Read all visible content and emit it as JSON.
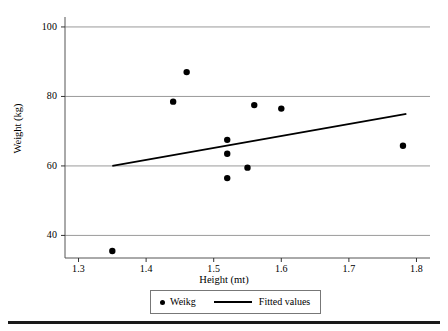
{
  "chart_data": {
    "type": "scatter",
    "title": "",
    "xlabel": "Height (mt)",
    "ylabel": "Weight (kg)",
    "xlim": [
      1.28,
      1.82
    ],
    "ylim": [
      33.5,
      102.0
    ],
    "xticks": [
      "1.3",
      "1.4",
      "1.5",
      "1.6",
      "1.7",
      "1.8"
    ],
    "xtick_values": [
      1.3,
      1.4,
      1.5,
      1.6,
      1.7,
      1.8
    ],
    "yticks": [
      "40",
      "60",
      "80",
      "100"
    ],
    "ytick_values": [
      40,
      60,
      80,
      100
    ],
    "grid": "horizontal",
    "legend_position": "below-axes",
    "series": [
      {
        "name": "Weikg",
        "type": "scatter",
        "marker": "circle",
        "color": "#000000",
        "points": [
          {
            "x": 1.35,
            "y": 35.5
          },
          {
            "x": 1.44,
            "y": 78.5
          },
          {
            "x": 1.46,
            "y": 87.0
          },
          {
            "x": 1.52,
            "y": 67.5
          },
          {
            "x": 1.52,
            "y": 63.5
          },
          {
            "x": 1.52,
            "y": 56.5
          },
          {
            "x": 1.55,
            "y": 59.5
          },
          {
            "x": 1.56,
            "y": 77.5
          },
          {
            "x": 1.6,
            "y": 76.5
          },
          {
            "x": 1.78,
            "y": 65.8
          }
        ]
      },
      {
        "name": "Fitted values",
        "type": "line",
        "color": "#000000",
        "points": [
          {
            "x": 1.35,
            "y": 60.0
          },
          {
            "x": 1.785,
            "y": 75.0
          }
        ]
      }
    ]
  },
  "legend": {
    "entries": [
      {
        "label": "Weikg",
        "glyph": "dot-marker"
      },
      {
        "label": "Fitted values",
        "glyph": "line-marker"
      }
    ]
  }
}
